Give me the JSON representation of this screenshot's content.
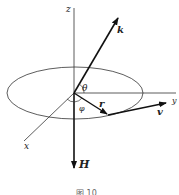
{
  "diagram": {
    "axes": {
      "z_label": "z",
      "y_label": "y",
      "x_label": "x"
    },
    "vectors": {
      "k_label": "k",
      "r_label": "r",
      "v_label": "v",
      "H_label": "H"
    },
    "angles": {
      "theta_label": "θ",
      "phi_label": "φ"
    },
    "caption": "图 10"
  }
}
